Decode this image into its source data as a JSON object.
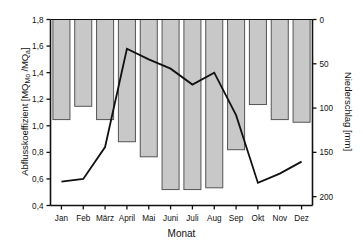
{
  "chart_data": {
    "type": "bar",
    "title": "",
    "subtitle": "",
    "xlabel": "Monat",
    "ylabel": "Abflusskoeffizient [MQ_Mo /MQ_a]",
    "ylabel_main": "Abflusskoeffizient [MQ",
    "ylabel_sub1": "Mo",
    "ylabel_mid": " /MQ",
    "ylabel_sub2": "a",
    "ylabel_end": "]",
    "y2label": "Niederschlag [mm]",
    "categories": [
      "Jan",
      "Feb",
      "März",
      "April",
      "Mai",
      "Juni",
      "Juli",
      "Aug",
      "Sep",
      "Okt",
      "Nov",
      "Dez"
    ],
    "grid": false,
    "legend": "none",
    "ylim": [
      0.4,
      1.8
    ],
    "y2lim": [
      0,
      210
    ],
    "y2_inverted": true,
    "yticks": [
      "0,4",
      "0,6",
      "0,8",
      "1,0",
      "1,2",
      "1,4",
      "1,6",
      "1,8"
    ],
    "ytick_values": [
      0.4,
      0.6,
      0.8,
      1.0,
      1.2,
      1.4,
      1.6,
      1.8
    ],
    "y2ticks": [
      "0",
      "50",
      "100",
      "150",
      "200"
    ],
    "y2tick_values": [
      0,
      50,
      100,
      150,
      200
    ],
    "series": [
      {
        "name": "Niederschlag",
        "type": "bar",
        "axis": "right",
        "unit": "mm",
        "color": "#c8c8c8",
        "edge_color": "#555555",
        "values": [
          113,
          98,
          113,
          138,
          155,
          192,
          192,
          190,
          147,
          96,
          113,
          116
        ]
      },
      {
        "name": "Abflusskoeffizient",
        "type": "line",
        "axis": "left",
        "color": "#111111",
        "values": [
          0.58,
          0.6,
          0.84,
          1.58,
          1.5,
          1.43,
          1.31,
          1.4,
          1.08,
          0.57,
          0.64,
          0.73
        ]
      }
    ]
  }
}
